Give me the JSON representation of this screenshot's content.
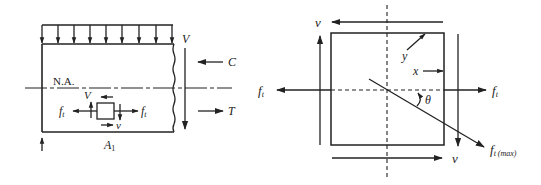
{
  "left_figure": {
    "labels": {
      "shear_V": "V",
      "compression": "C",
      "tension": "T",
      "neutral_axis": "N.A.",
      "element_shear_V": "V",
      "element_shear_v": "v",
      "tension_left": "f",
      "tension_left_sub": "t",
      "tension_right": "f",
      "tension_right_sub": "t",
      "area": "A",
      "area_sub": "1"
    },
    "distributed_load_arrow_count": 9
  },
  "right_figure": {
    "labels": {
      "shear_top": "v",
      "shear_bottom": "v",
      "tension_left": "f",
      "tension_left_sub": "t",
      "tension_right": "f",
      "tension_right_sub": "t",
      "principal": "f",
      "principal_sub": "t (max)",
      "angle": "θ",
      "x_label": "x",
      "y_label": "y"
    }
  }
}
